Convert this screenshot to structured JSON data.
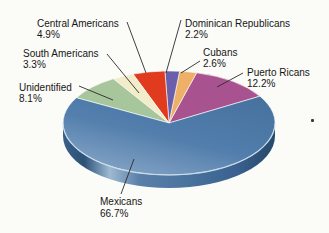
{
  "chart_data": {
    "type": "pie",
    "style": "3d",
    "unit": "%",
    "legend": "none",
    "slices": [
      {
        "label": "Puerto Ricans",
        "value": 12.2,
        "display": "12.2%",
        "color": "#a8538f"
      },
      {
        "label": "Cubans",
        "value": 2.6,
        "display": "2.6%",
        "color": "#eeb066"
      },
      {
        "label": "Dominican Republicans",
        "value": 2.2,
        "display": "2.2%",
        "color": "#6a5fab"
      },
      {
        "label": "Central Americans",
        "value": 4.9,
        "display": "4.9%",
        "color": "#e03a1f"
      },
      {
        "label": "South Americans",
        "value": 3.3,
        "display": "3.3%",
        "color": "#f2ecca"
      },
      {
        "label": "Unidentified",
        "value": 8.1,
        "display": "8.1%",
        "color": "#a8c69b"
      },
      {
        "label": "Mexicans",
        "value": 66.7,
        "display": "66.7%",
        "color": "#5480ac"
      }
    ],
    "layout": {
      "start_angle_deg": 31,
      "winding": "ccw",
      "cx": 169,
      "cy": 123,
      "rx": 106,
      "ry": 52,
      "depth": 13,
      "background": "#fbfbf8",
      "rim_highlight": "#a9c2da",
      "rim_dark": "#2b4e73",
      "label_color": "#161616"
    }
  }
}
